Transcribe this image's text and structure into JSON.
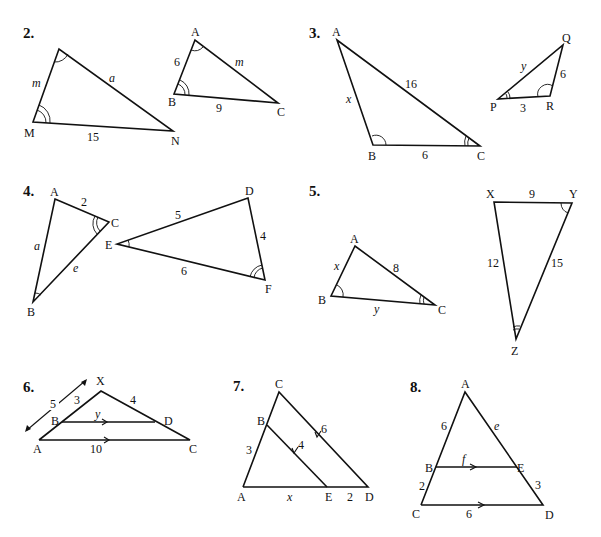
{
  "problems": [
    {
      "number": "2.",
      "figures": [
        {
          "vertices": {
            "top": "",
            "M": "M",
            "N": "N"
          },
          "sides": {
            "top_M": "m",
            "top_N": "a",
            "M_N": "15"
          },
          "angle_marks": {
            "top": "single",
            "M": "double"
          }
        },
        {
          "vertices": {
            "A": "A",
            "B": "B",
            "C": "C"
          },
          "sides": {
            "AB": "6",
            "AC": "m",
            "BC": "9"
          },
          "angle_marks": {
            "A": "single",
            "B": "double"
          }
        }
      ]
    },
    {
      "number": "3.",
      "figures": [
        {
          "vertices": {
            "A": "A",
            "B": "B",
            "C": "C"
          },
          "sides": {
            "AB": "x",
            "AC": "16",
            "BC": "6"
          },
          "angle_marks": {
            "B": "single",
            "C": "double"
          }
        },
        {
          "vertices": {
            "P": "P",
            "Q": "Q",
            "R": "R"
          },
          "sides": {
            "PQ": "y",
            "QR": "6",
            "PR": "3"
          },
          "angle_marks": {
            "P": "double",
            "R": "single"
          }
        }
      ]
    },
    {
      "number": "4.",
      "figures": [
        {
          "vertices": {
            "A": "A",
            "B": "B",
            "C": "C"
          },
          "sides": {
            "AC": "2",
            "AB": "a",
            "BC": "e"
          },
          "angle_marks": {
            "C": "double",
            "B": "single"
          }
        },
        {
          "vertices": {
            "D": "D",
            "E": "E",
            "F": "F"
          },
          "sides": {
            "DE": "5",
            "DF": "4",
            "EF": "6"
          },
          "angle_marks": {
            "E": "single",
            "F": "double"
          }
        }
      ]
    },
    {
      "number": "5.",
      "figures": [
        {
          "vertices": {
            "A": "A",
            "B": "B",
            "C": "C"
          },
          "sides": {
            "AB": "x",
            "AC": "8",
            "BC": "y"
          },
          "angle_marks": {
            "B": "single",
            "C": "double"
          }
        },
        {
          "vertices": {
            "X": "X",
            "Y": "Y",
            "Z": "Z"
          },
          "sides": {
            "XY": "9",
            "XZ": "12",
            "YZ": "15"
          },
          "angle_marks": {
            "Y": "single",
            "Z": "double"
          }
        }
      ]
    },
    {
      "number": "6.",
      "figures": [
        {
          "vertices": {
            "X": "X",
            "B": "B",
            "D": "D",
            "A": "A",
            "C": "C"
          },
          "sides": {
            "XA_total": "5",
            "XB": "3",
            "XD": "4",
            "BD": "y",
            "AC": "10"
          },
          "parallel": [
            "BD",
            "AC"
          ]
        }
      ]
    },
    {
      "number": "7.",
      "figures": [
        {
          "vertices": {
            "C": "C",
            "B": "B",
            "A": "A",
            "E": "E",
            "D": "D"
          },
          "sides": {
            "AB": "3",
            "BE": "4",
            "CD": "6",
            "AE": "x",
            "ED": "2"
          },
          "parallel": [
            "BE",
            "CD"
          ]
        }
      ]
    },
    {
      "number": "8.",
      "figures": [
        {
          "vertices": {
            "A": "A",
            "B": "B",
            "E": "E",
            "C": "C",
            "D": "D"
          },
          "sides": {
            "AB": "6",
            "AE": "e",
            "BE": "f",
            "BC": "2",
            "ED": "3",
            "CD": "6"
          },
          "parallel": [
            "BE",
            "CD"
          ]
        }
      ]
    }
  ]
}
